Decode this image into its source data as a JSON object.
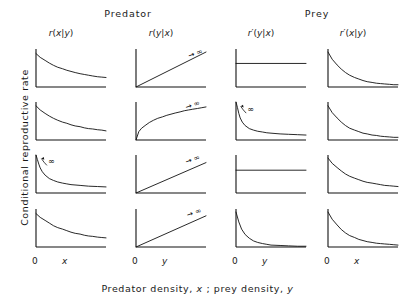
{
  "figure": {
    "y_axis_title": "Conditional reproductive rate",
    "x_axis_title_parts": {
      "p1": "Predator density, ",
      "v1": "x",
      "p2": " ; prey density, ",
      "v2": "y"
    },
    "groups": [
      {
        "name": "predator-group",
        "label": "Predator"
      },
      {
        "name": "prey-group",
        "label": "Prey"
      }
    ],
    "columns": [
      {
        "header": "r(x|y)",
        "base": "r",
        "prime": "",
        "args": "(x|y)",
        "axis_tick_zero": "0",
        "axis_tick_var": "x"
      },
      {
        "header": "r(y|x)",
        "base": "r",
        "prime": "",
        "args": "(y|x)",
        "axis_tick_zero": "0",
        "axis_tick_var": "y"
      },
      {
        "header": "r'(y|x)",
        "base": "r",
        "prime": "′",
        "args": "(y|x)",
        "axis_tick_zero": "0",
        "axis_tick_var": "y"
      },
      {
        "header": "r'(x|y)",
        "base": "r",
        "prime": "′",
        "args": "(x|y)",
        "axis_tick_zero": "0",
        "axis_tick_var": "x"
      }
    ],
    "infinity_symbol": "∞",
    "arrow_symbol": "→"
  },
  "chart_data": {
    "type": "line",
    "title": "",
    "xlabel": "Predator density, x ; prey density, y",
    "ylabel": "Conditional reproductive rate",
    "grid": false,
    "legend": "none",
    "layout": {
      "rows": 4,
      "cols": 4
    },
    "xlim": [
      0,
      1
    ],
    "ylim": [
      0,
      1
    ],
    "column_titles": [
      "r(x|y)",
      "r(y|x)",
      "r′(y|x)",
      "r′(x|y)"
    ],
    "group_titles": [
      "Predator",
      "Prey"
    ],
    "panels": [
      {
        "row": 1,
        "col": 1,
        "series_name": "r(x|y) row1",
        "shape": "decay-moderate",
        "x": [
          0.0,
          0.06,
          0.13,
          0.19,
          0.25,
          0.31,
          0.38,
          0.44,
          0.5,
          0.56,
          0.63,
          0.69,
          0.75,
          0.81,
          0.88,
          0.94,
          1.0
        ],
        "y": [
          0.88,
          0.78,
          0.7,
          0.63,
          0.57,
          0.52,
          0.48,
          0.44,
          0.41,
          0.38,
          0.35,
          0.33,
          0.31,
          0.29,
          0.27,
          0.26,
          0.25
        ],
        "annotation": null
      },
      {
        "row": 1,
        "col": 2,
        "series_name": "r(y|x) row1",
        "shape": "linear-rise",
        "x": [
          0.0,
          1.0
        ],
        "y": [
          0.0,
          0.92
        ],
        "annotation": {
          "text": "→ ∞",
          "x": 0.76,
          "y": 0.86
        }
      },
      {
        "row": 1,
        "col": 3,
        "series_name": "r′(y|x) row1",
        "shape": "constant",
        "x": [
          0.0,
          1.0
        ],
        "y": [
          0.62,
          0.62
        ],
        "annotation": null
      },
      {
        "row": 1,
        "col": 4,
        "series_name": "r′(x|y) row1",
        "shape": "decay-steep",
        "x": [
          0.0,
          0.06,
          0.13,
          0.19,
          0.25,
          0.31,
          0.38,
          0.44,
          0.5,
          0.56,
          0.63,
          0.69,
          0.75,
          0.81,
          0.88,
          0.94,
          1.0
        ],
        "y": [
          0.92,
          0.73,
          0.58,
          0.47,
          0.38,
          0.31,
          0.25,
          0.21,
          0.17,
          0.14,
          0.12,
          0.1,
          0.09,
          0.08,
          0.07,
          0.06,
          0.06
        ],
        "annotation": null
      },
      {
        "row": 2,
        "col": 1,
        "series_name": "r(x|y) row2",
        "shape": "decay-moderate",
        "x": [
          0.0,
          0.06,
          0.13,
          0.19,
          0.25,
          0.31,
          0.38,
          0.44,
          0.5,
          0.56,
          0.63,
          0.69,
          0.75,
          0.81,
          0.88,
          0.94,
          1.0
        ],
        "y": [
          0.9,
          0.79,
          0.7,
          0.63,
          0.57,
          0.52,
          0.47,
          0.44,
          0.4,
          0.37,
          0.35,
          0.32,
          0.3,
          0.29,
          0.27,
          0.26,
          0.24
        ],
        "annotation": null
      },
      {
        "row": 2,
        "col": 2,
        "series_name": "r(y|x) row2",
        "shape": "saturating-rise",
        "x": [
          0.0,
          0.04,
          0.08,
          0.13,
          0.19,
          0.25,
          0.31,
          0.38,
          0.44,
          0.5,
          0.56,
          0.63,
          0.69,
          0.75,
          0.81,
          0.88,
          0.94,
          1.0
        ],
        "y": [
          0.0,
          0.22,
          0.31,
          0.38,
          0.46,
          0.52,
          0.57,
          0.61,
          0.65,
          0.68,
          0.71,
          0.74,
          0.77,
          0.79,
          0.81,
          0.83,
          0.85,
          0.87
        ],
        "annotation": {
          "text": "→ ∞",
          "x": 0.72,
          "y": 0.9
        }
      },
      {
        "row": 2,
        "col": 3,
        "series_name": "r′(y|x) row2",
        "shape": "decay-asymptotic-infinite",
        "x": [
          0.0,
          0.02,
          0.04,
          0.06,
          0.09,
          0.13,
          0.19,
          0.25,
          0.31,
          0.38,
          0.44,
          0.5,
          0.63,
          0.75,
          0.88,
          1.0
        ],
        "y": [
          1.0,
          0.86,
          0.7,
          0.58,
          0.47,
          0.38,
          0.3,
          0.26,
          0.23,
          0.21,
          0.19,
          0.18,
          0.16,
          0.15,
          0.14,
          0.13
        ],
        "annotation": {
          "text": "∞",
          "x": 0.16,
          "y": 0.97,
          "arrow": true
        }
      },
      {
        "row": 2,
        "col": 4,
        "series_name": "r′(x|y) row2",
        "shape": "decay-steep",
        "x": [
          0.0,
          0.06,
          0.13,
          0.19,
          0.25,
          0.31,
          0.38,
          0.44,
          0.5,
          0.56,
          0.63,
          0.69,
          0.75,
          0.81,
          0.88,
          0.94,
          1.0
        ],
        "y": [
          0.9,
          0.72,
          0.58,
          0.47,
          0.38,
          0.31,
          0.26,
          0.22,
          0.18,
          0.16,
          0.13,
          0.12,
          0.1,
          0.09,
          0.08,
          0.07,
          0.07
        ],
        "annotation": null
      },
      {
        "row": 3,
        "col": 1,
        "series_name": "r(x|y) row3",
        "shape": "decay-asymptotic-infinite",
        "x": [
          0.0,
          0.02,
          0.04,
          0.06,
          0.09,
          0.13,
          0.19,
          0.25,
          0.31,
          0.38,
          0.44,
          0.5,
          0.63,
          0.75,
          0.88,
          1.0
        ],
        "y": [
          1.0,
          0.88,
          0.76,
          0.66,
          0.56,
          0.47,
          0.38,
          0.33,
          0.29,
          0.26,
          0.24,
          0.22,
          0.2,
          0.18,
          0.17,
          0.16
        ],
        "annotation": {
          "text": "∞",
          "x": 0.17,
          "y": 0.99,
          "arrow": true
        }
      },
      {
        "row": 3,
        "col": 2,
        "series_name": "r(y|x) row3",
        "shape": "linear-rise",
        "x": [
          0.0,
          1.0
        ],
        "y": [
          0.0,
          0.8
        ],
        "annotation": {
          "text": "→ ∞",
          "x": 0.72,
          "y": 0.86
        }
      },
      {
        "row": 3,
        "col": 3,
        "series_name": "r′(y|x) row3",
        "shape": "constant",
        "x": [
          0.0,
          1.0
        ],
        "y": [
          0.6,
          0.6
        ],
        "annotation": null
      },
      {
        "row": 3,
        "col": 4,
        "series_name": "r′(x|y) row3",
        "shape": "decay-moderate",
        "x": [
          0.0,
          0.06,
          0.13,
          0.19,
          0.25,
          0.31,
          0.38,
          0.44,
          0.5,
          0.56,
          0.63,
          0.69,
          0.75,
          0.81,
          0.88,
          0.94,
          1.0
        ],
        "y": [
          0.92,
          0.78,
          0.67,
          0.58,
          0.5,
          0.44,
          0.39,
          0.35,
          0.31,
          0.28,
          0.26,
          0.24,
          0.22,
          0.2,
          0.19,
          0.18,
          0.17
        ],
        "annotation": null
      },
      {
        "row": 4,
        "col": 1,
        "series_name": "r(x|y) row4",
        "shape": "decay-moderate",
        "x": [
          0.0,
          0.06,
          0.13,
          0.19,
          0.25,
          0.31,
          0.38,
          0.44,
          0.5,
          0.56,
          0.63,
          0.69,
          0.75,
          0.81,
          0.88,
          0.94,
          1.0
        ],
        "y": [
          0.88,
          0.78,
          0.7,
          0.63,
          0.56,
          0.51,
          0.47,
          0.43,
          0.39,
          0.36,
          0.34,
          0.31,
          0.29,
          0.28,
          0.26,
          0.25,
          0.24
        ],
        "annotation": null
      },
      {
        "row": 4,
        "col": 2,
        "series_name": "r(y|x) row4",
        "shape": "linear-rise",
        "x": [
          0.0,
          1.0
        ],
        "y": [
          0.0,
          0.82
        ],
        "annotation": {
          "text": "→ ∞",
          "x": 0.74,
          "y": 0.88
        }
      },
      {
        "row": 4,
        "col": 3,
        "series_name": "r′(y|x) row4",
        "shape": "decay-very-steep",
        "x": [
          0.0,
          0.04,
          0.08,
          0.13,
          0.19,
          0.25,
          0.31,
          0.38,
          0.44,
          0.5,
          0.63,
          0.75,
          0.88,
          1.0
        ],
        "y": [
          0.92,
          0.66,
          0.47,
          0.33,
          0.23,
          0.16,
          0.12,
          0.09,
          0.07,
          0.05,
          0.04,
          0.03,
          0.02,
          0.02
        ],
        "annotation": null
      },
      {
        "row": 4,
        "col": 4,
        "series_name": "r′(x|y) row4",
        "shape": "decay-steep",
        "x": [
          0.0,
          0.06,
          0.13,
          0.19,
          0.25,
          0.31,
          0.38,
          0.44,
          0.5,
          0.56,
          0.63,
          0.69,
          0.75,
          0.81,
          0.88,
          0.94,
          1.0
        ],
        "y": [
          0.92,
          0.73,
          0.58,
          0.46,
          0.37,
          0.3,
          0.25,
          0.2,
          0.17,
          0.14,
          0.12,
          0.1,
          0.09,
          0.08,
          0.07,
          0.06,
          0.05
        ]
      }
    ]
  }
}
